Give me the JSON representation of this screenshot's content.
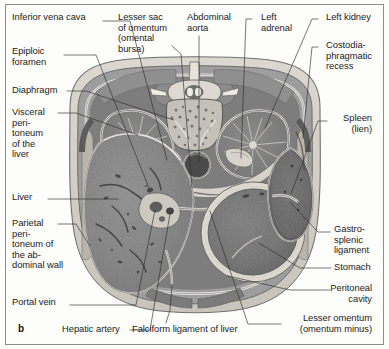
{
  "figure": {
    "panel_letter": "b",
    "type": "axial abdominal cross-section",
    "border_color": "#8e8e8e",
    "background_color": "#fdfdfb",
    "text_color": "#1c1c1c"
  },
  "labels": {
    "inferior_vena_cava": "Inferior vena cava",
    "lesser_sac": "Lesser sac\nof omentum\n(omental\nbursa)",
    "abdominal_aorta": "Abdominal\naorta",
    "left_adrenal": "Left\nadrenal",
    "left_kidney": "Left kidney",
    "epiploic_foramen": "Epiploic\nforamen",
    "costodiaphragmatic_recess": "Costodia-\nphragmatic\nrecess",
    "diaphragm": "Diaphragm",
    "visceral_peritoneum": "Visceral\nperi-\ntoneum\nof the\nliver",
    "spleen": "Spleen\n(lien)",
    "liver": "Liver",
    "parietal_peritoneum": "Parietal\nperi-\ntoneum of\nthe ab-\ndominal wall",
    "gastrosplenic_ligament": "Gastro-\nsplenic\nligament",
    "stomach": "Stomach",
    "peritoneal_cavity": "Peritoneal\ncavity",
    "portal_vein": "Portal vein",
    "hepatic_artery": "Hepatic artery",
    "falciform_ligament": "Falciform ligament of liver",
    "lesser_omentum": "Lesser omentum\n(omentum minus)"
  },
  "structures": {
    "body_wall": "abdominal body wall",
    "liver": "liver parenchyma",
    "stomach": "stomach lumen and wall",
    "spleen": "spleen",
    "right_kidney": "right kidney",
    "left_kidney": "left kidney",
    "vertebra": "lumbar vertebral body",
    "aorta": "abdominal aorta",
    "inferior_vena_cava": "inferior vena cava",
    "spinal_cord": "spinal canal contents",
    "pancreas": "pancreas / lesser sac region",
    "erector_spinae": "erector spinae muscles"
  }
}
